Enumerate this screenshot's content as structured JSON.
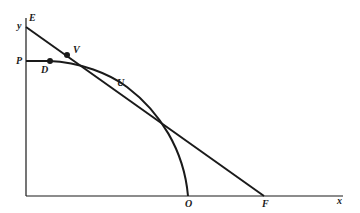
{
  "diagram": {
    "colors": {
      "ink": "#1a1a1a",
      "background": "#ffffff"
    },
    "axes": {
      "x_label": "x",
      "y_label": "y"
    },
    "points": {
      "E": "E",
      "V": "V",
      "P": "P",
      "D": "D",
      "U": "U",
      "O": "O",
      "F": "F"
    },
    "elements": [
      {
        "type": "line",
        "name": "tangent EF",
        "from": "E",
        "to": "F"
      },
      {
        "type": "curve",
        "name": "frontier PO",
        "from": "P",
        "through": [
          "D",
          "U"
        ],
        "to": "O"
      },
      {
        "type": "dot",
        "at": "V"
      },
      {
        "type": "dot",
        "at": "D"
      }
    ]
  }
}
